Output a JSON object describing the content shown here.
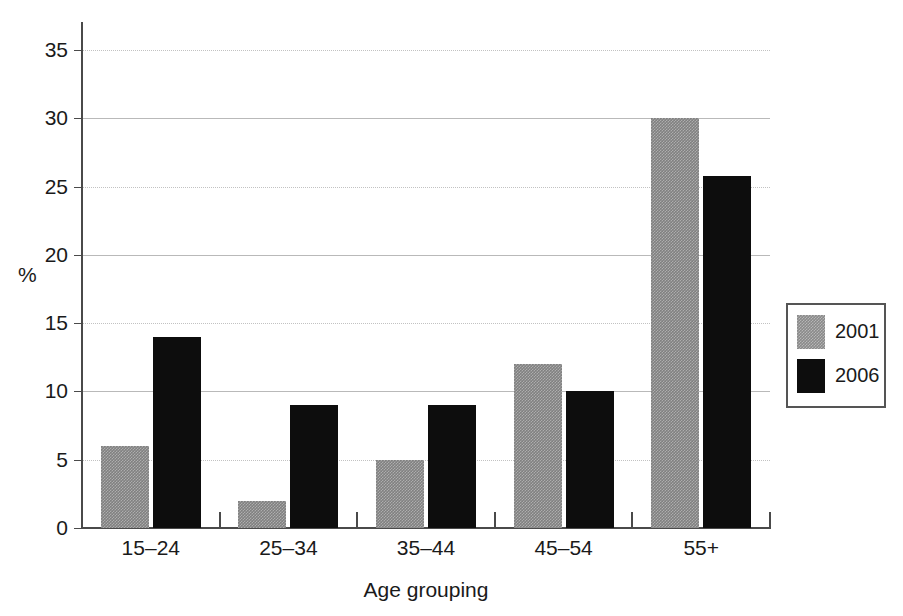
{
  "chart_data": {
    "type": "bar",
    "title": "",
    "subtitle": "",
    "xlabel": "Age grouping",
    "ylabel": "%",
    "categories": [
      "15–24",
      "25–34",
      "35–44",
      "45–54",
      "55+"
    ],
    "series": [
      {
        "name": "2001",
        "color": "#808080",
        "values": [
          6,
          2,
          5,
          12,
          30
        ]
      },
      {
        "name": "2006",
        "color": "#0d0d0d",
        "values": [
          14,
          9,
          9,
          10,
          25.8
        ]
      }
    ],
    "ylim": [
      0,
      35
    ],
    "ytick_values": [
      0,
      5,
      10,
      15,
      20,
      25,
      30,
      35
    ],
    "ytick_labels": [
      "0",
      "5",
      "10",
      "15",
      "20",
      "25",
      "30",
      "35"
    ],
    "grid": true,
    "grid_axis": "y",
    "legend": {
      "position": "right-outside",
      "entries": [
        {
          "label": "2001",
          "swatch": "gray-hatched"
        },
        {
          "label": "2006",
          "swatch": "black-solid"
        }
      ]
    },
    "colors": {
      "series_2001": "#808080",
      "series_2006": "#0d0d0d",
      "axis": "#4a4a4a",
      "gridline": "#b9b9b9",
      "text": "#1a1a1a",
      "background": "#ffffff"
    }
  }
}
